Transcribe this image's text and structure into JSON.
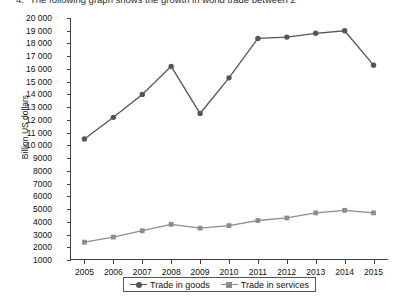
{
  "question": {
    "number": "4.",
    "text": "The following graph shows the growth in world trade between 2"
  },
  "chart_data": {
    "type": "line",
    "title": "",
    "xlabel": "",
    "ylabel": "Billion US dollars",
    "categories": [
      "2005",
      "2006",
      "2007",
      "2008",
      "2009",
      "2010",
      "2011",
      "2012",
      "2013",
      "2014",
      "2015"
    ],
    "series": [
      {
        "name": "Trade in goods",
        "marker": "circle",
        "color": "#555555",
        "values": [
          10500,
          12200,
          14000,
          16200,
          12500,
          15300,
          18400,
          18500,
          18800,
          19000,
          16300
        ]
      },
      {
        "name": "Trade in services",
        "marker": "square",
        "color": "#8d8d8d",
        "values": [
          2400,
          2800,
          3300,
          3800,
          3500,
          3700,
          4100,
          4300,
          4700,
          4900,
          4700
        ]
      }
    ],
    "ylim": [
      1000,
      20000
    ],
    "ystep": 1000,
    "ytick_labels": [
      "20 000",
      "19 000",
      "18 000",
      "17 000",
      "16 000",
      "15 000",
      "14 000",
      "13 000",
      "12 000",
      "11 000",
      "10 000",
      "9000",
      "8000",
      "7000",
      "6000",
      "5000",
      "4000",
      "3000",
      "2000",
      "1000"
    ],
    "grid": false,
    "legend_position": "bottom"
  }
}
